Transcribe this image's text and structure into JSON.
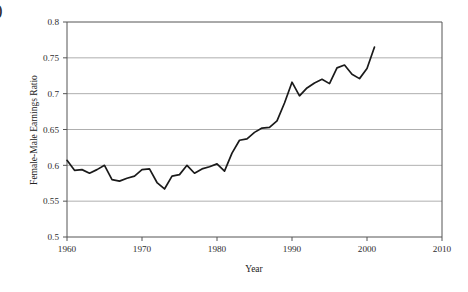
{
  "figure": {
    "clipped_corner_char": "0"
  },
  "chart_data": {
    "type": "line",
    "title": "",
    "xlabel": "Year",
    "ylabel": "Female-Male Earnings Ratio",
    "xlim": [
      1960,
      2010
    ],
    "ylim": [
      0.5,
      0.8
    ],
    "xticks": [
      1960,
      1970,
      1980,
      1990,
      2000,
      2010
    ],
    "xtick_labels": [
      "1960",
      "1970",
      "1980",
      "1990",
      "2000",
      "2010"
    ],
    "yticks": [
      0.5,
      0.55,
      0.6,
      0.65,
      0.7,
      0.75,
      0.8
    ],
    "ytick_labels": [
      "0.5",
      "0.55",
      "0.6",
      "0.65",
      "0.7",
      "0.75",
      "0.8"
    ],
    "grid": "horizontal",
    "legend": "none",
    "line_color": "#1a1a1a",
    "line_width": 1.7,
    "x": [
      1960,
      1961,
      1962,
      1963,
      1964,
      1965,
      1966,
      1967,
      1968,
      1969,
      1970,
      1971,
      1972,
      1973,
      1974,
      1975,
      1976,
      1977,
      1978,
      1979,
      1980,
      1981,
      1982,
      1983,
      1984,
      1985,
      1986,
      1987,
      1988,
      1989,
      1990,
      1991,
      1992,
      1993,
      1994,
      1995,
      1996,
      1997,
      1998,
      1999,
      2000,
      2001
    ],
    "values": [
      0.607,
      0.593,
      0.594,
      0.589,
      0.594,
      0.6,
      0.58,
      0.578,
      0.582,
      0.585,
      0.594,
      0.595,
      0.576,
      0.567,
      0.585,
      0.587,
      0.6,
      0.589,
      0.595,
      0.598,
      0.602,
      0.592,
      0.617,
      0.635,
      0.637,
      0.646,
      0.652,
      0.653,
      0.662,
      0.687,
      0.716,
      0.697,
      0.708,
      0.715,
      0.72,
      0.714,
      0.736,
      0.74,
      0.727,
      0.721,
      0.735,
      0.765
    ]
  }
}
